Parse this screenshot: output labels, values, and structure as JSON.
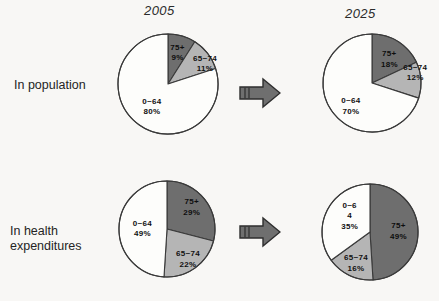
{
  "figure": {
    "column_titles": [
      "2005",
      "2025"
    ],
    "row_labels": [
      "In population",
      "In health\nexpenditures"
    ],
    "arrow_icon": "right-block-arrow",
    "colors": {
      "background": "#f8f7f5",
      "slice_white": "#fdfdfb",
      "slice_light_gray": "#b5b5b5",
      "slice_dark_gray": "#6e6e6e",
      "outline": "#3a3a3a",
      "arrow_fill": "#6f6f6f",
      "arrow_outline": "#2e2e2e",
      "text": "#1a1a1a"
    }
  },
  "chart_data": [
    {
      "type": "pie",
      "title": "2005",
      "row": "In population",
      "start_angle_deg": 0,
      "direction": "clockwise",
      "categories": [
        "75+",
        "65~74",
        "0~64"
      ],
      "values": [
        9,
        11,
        80
      ],
      "labels": [
        "75+\n9%",
        "65~74\n11%",
        "0~64\n80%"
      ],
      "colors": [
        "#6e6e6e",
        "#b5b5b5",
        "#fdfdfb"
      ],
      "unit": "%"
    },
    {
      "type": "pie",
      "title": "2025",
      "row": "In population",
      "start_angle_deg": 0,
      "direction": "clockwise",
      "categories": [
        "75+",
        "65~74",
        "0~64"
      ],
      "values": [
        18,
        12,
        70
      ],
      "labels": [
        "75+\n18%",
        "65~74\n12%",
        "0~64\n70%"
      ],
      "colors": [
        "#6e6e6e",
        "#b5b5b5",
        "#fdfdfb"
      ],
      "unit": "%"
    },
    {
      "type": "pie",
      "title": "2005",
      "row": "In health expenditures",
      "start_angle_deg": 0,
      "direction": "clockwise",
      "categories": [
        "75+",
        "65~74",
        "0~64"
      ],
      "values": [
        29,
        22,
        49
      ],
      "labels": [
        "75+\n29%",
        "65~74\n22%",
        "0~64\n49%"
      ],
      "colors": [
        "#6e6e6e",
        "#b5b5b5",
        "#fdfdfb"
      ],
      "unit": "%"
    },
    {
      "type": "pie",
      "title": "2025",
      "row": "In health expenditures",
      "start_angle_deg": 0,
      "direction": "clockwise",
      "categories": [
        "75+",
        "65~74",
        "0~64"
      ],
      "values": [
        49,
        16,
        35
      ],
      "labels": [
        "75+\n49%",
        "65~74\n16%",
        "0~6\n4\n35%"
      ],
      "colors": [
        "#6e6e6e",
        "#b5b5b5",
        "#fdfdfb"
      ],
      "unit": "%"
    }
  ]
}
